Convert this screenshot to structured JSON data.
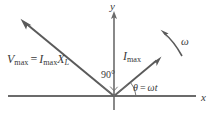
{
  "figure": {
    "type": "phasor-diagram",
    "colors": {
      "axis": "#6b6b6b",
      "vector": "#5a5a5a",
      "text": "#3a3a3a",
      "background": "#ffffff"
    },
    "axes": {
      "x_label": "x",
      "y_label": "y",
      "origin": {
        "x": 114,
        "y": 96
      },
      "x_start": {
        "x": 8,
        "y": 96
      },
      "x_end": {
        "x": 196,
        "y": 96
      },
      "y_top": {
        "x": 114,
        "y": 12
      },
      "y_bottom": {
        "x": 114,
        "y": 110
      }
    },
    "vectors": [
      {
        "name": "voltage-phasor",
        "label": "V",
        "label_sub": "max",
        "equals": "=",
        "label2": "I",
        "label2_sub": "max",
        "label3": "X",
        "label3_sub": "L",
        "from": {
          "x": 114,
          "y": 96
        },
        "to": {
          "x": 22,
          "y": 20
        }
      },
      {
        "name": "current-phasor",
        "label": "I",
        "label_sub": "max",
        "from": {
          "x": 114,
          "y": 96
        },
        "to": {
          "x": 161,
          "y": 57
        }
      }
    ],
    "annotations": {
      "right_angle": "90°",
      "angle_expression_theta": "θ",
      "angle_expression_equals": "=",
      "angle_expression_omega": "ω",
      "angle_expression_t": "t",
      "angular_velocity": "ω"
    }
  }
}
